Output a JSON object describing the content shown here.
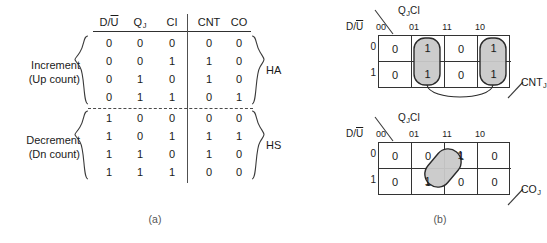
{
  "figure": {
    "captions": {
      "a": "(a)",
      "b": "(b)"
    }
  },
  "truth_table": {
    "headers": {
      "in1": "D/U",
      "in1_overline": "U",
      "in2": "Q",
      "in2_sub": "J",
      "in3": "CI",
      "out1": "CNT",
      "out2": "CO"
    },
    "group_labels": [
      {
        "line1": "Increment",
        "line2": "(Up count)"
      },
      {
        "line1": "Decrement",
        "line2": "(Dn count)"
      }
    ],
    "side_labels": [
      "HA",
      "HS"
    ],
    "increment_rows": [
      {
        "du": "0",
        "qj": "0",
        "ci": "0",
        "cnt": "0",
        "co": "0"
      },
      {
        "du": "0",
        "qj": "0",
        "ci": "1",
        "cnt": "1",
        "co": "0"
      },
      {
        "du": "0",
        "qj": "1",
        "ci": "0",
        "cnt": "1",
        "co": "0"
      },
      {
        "du": "0",
        "qj": "1",
        "ci": "1",
        "cnt": "0",
        "co": "1"
      }
    ],
    "decrement_rows": [
      {
        "du": "1",
        "qj": "0",
        "ci": "0",
        "cnt": "0",
        "co": "0"
      },
      {
        "du": "1",
        "qj": "0",
        "ci": "1",
        "cnt": "1",
        "co": "1"
      },
      {
        "du": "1",
        "qj": "1",
        "ci": "0",
        "cnt": "1",
        "co": "0"
      },
      {
        "du": "1",
        "qj": "1",
        "ci": "1",
        "cnt": "0",
        "co": "0"
      }
    ]
  },
  "kmaps": [
    {
      "id": "cnt",
      "output_label": "CNT",
      "output_sub": "J",
      "top_var": "Q",
      "top_var_sub": "J",
      "top_var2": "CI",
      "left_var": "D/U",
      "left_var_overline": "U",
      "col_labels": [
        "00",
        "01",
        "11",
        "10"
      ],
      "row_labels": [
        "0",
        "1"
      ],
      "cells": [
        [
          "0",
          "1",
          "0",
          "1"
        ],
        [
          "0",
          "1",
          "0",
          "1"
        ]
      ],
      "groups": [
        {
          "type": "column",
          "col": 1,
          "shaded": true
        },
        {
          "type": "column",
          "col": 3,
          "shaded": true
        }
      ],
      "wrap_arc": true
    },
    {
      "id": "co",
      "output_label": "CO",
      "output_sub": "J",
      "top_var": "Q",
      "top_var_sub": "J",
      "top_var2": "CI",
      "left_var": "D/U",
      "left_var_overline": "U",
      "col_labels": [
        "00",
        "01",
        "11",
        "10"
      ],
      "row_labels": [
        "0",
        "1"
      ],
      "cells": [
        [
          "0",
          "0",
          "1",
          "0"
        ],
        [
          "0",
          "1",
          "0",
          "0"
        ]
      ],
      "groups": [
        {
          "type": "diagonal",
          "from": [
            1,
            1
          ],
          "to": [
            0,
            2
          ],
          "shaded": true
        }
      ],
      "wrap_arc": false
    }
  ],
  "colors": {
    "line": "#333333",
    "shade_fill": "#c9c9c9",
    "shade_stroke": "#2b2b2b",
    "text": "#1a1a1a"
  }
}
